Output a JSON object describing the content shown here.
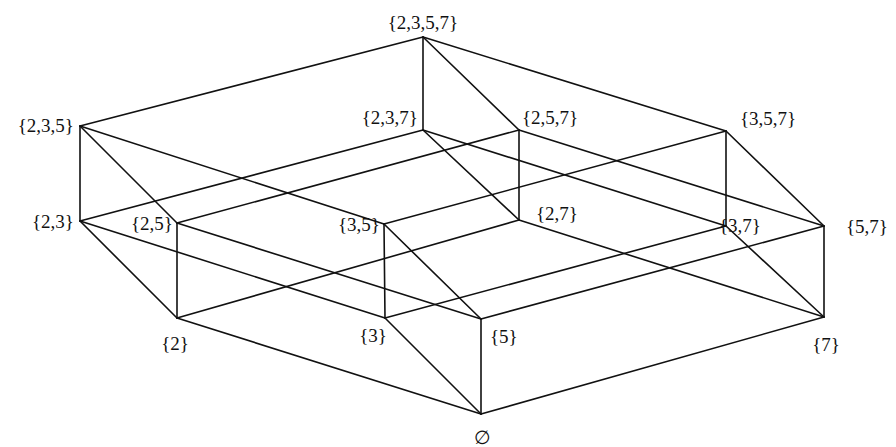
{
  "diagram": {
    "ground_set": [
      "2",
      "3",
      "5",
      "7"
    ],
    "vertices": [
      {
        "id": "empty",
        "label": "∅"
      },
      {
        "id": "2",
        "label": "{2}"
      },
      {
        "id": "3",
        "label": "{3}"
      },
      {
        "id": "5",
        "label": "{5}"
      },
      {
        "id": "7",
        "label": "{7}"
      },
      {
        "id": "23",
        "label": "{2,3}"
      },
      {
        "id": "25",
        "label": "{2,5}"
      },
      {
        "id": "27",
        "label": "{2,7}"
      },
      {
        "id": "35",
        "label": "{3,5}"
      },
      {
        "id": "37",
        "label": "{3,7}"
      },
      {
        "id": "57",
        "label": "{5,7}"
      },
      {
        "id": "235",
        "label": "{2,3,5}"
      },
      {
        "id": "237",
        "label": "{2,3,7}"
      },
      {
        "id": "257",
        "label": "{2,5,7}"
      },
      {
        "id": "357",
        "label": "{3,5,7}"
      },
      {
        "id": "2357",
        "label": "{2,3,5,7}"
      }
    ],
    "edges": [
      [
        "empty",
        "2"
      ],
      [
        "empty",
        "3"
      ],
      [
        "empty",
        "5"
      ],
      [
        "empty",
        "7"
      ],
      [
        "2",
        "23"
      ],
      [
        "2",
        "25"
      ],
      [
        "2",
        "27"
      ],
      [
        "3",
        "23"
      ],
      [
        "3",
        "35"
      ],
      [
        "3",
        "37"
      ],
      [
        "5",
        "25"
      ],
      [
        "5",
        "35"
      ],
      [
        "5",
        "57"
      ],
      [
        "7",
        "27"
      ],
      [
        "7",
        "37"
      ],
      [
        "7",
        "57"
      ],
      [
        "23",
        "235"
      ],
      [
        "23",
        "237"
      ],
      [
        "25",
        "235"
      ],
      [
        "25",
        "257"
      ],
      [
        "27",
        "237"
      ],
      [
        "27",
        "257"
      ],
      [
        "35",
        "235"
      ],
      [
        "35",
        "357"
      ],
      [
        "37",
        "237"
      ],
      [
        "37",
        "357"
      ],
      [
        "57",
        "257"
      ],
      [
        "57",
        "357"
      ],
      [
        "235",
        "2357"
      ],
      [
        "237",
        "2357"
      ],
      [
        "257",
        "2357"
      ],
      [
        "357",
        "2357"
      ]
    ]
  }
}
